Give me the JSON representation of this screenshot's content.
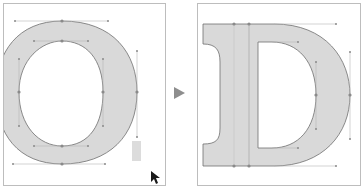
{
  "figure": {
    "source_glyph": "O",
    "target_glyph": "D",
    "transition": "arrow-right"
  },
  "colors": {
    "glyph_fill": "#d9d9d9",
    "outline": "#6e6e6e",
    "handle": "#9a9a9a",
    "frame": "#bdbdbd",
    "arrow": "#8e8e8e"
  }
}
